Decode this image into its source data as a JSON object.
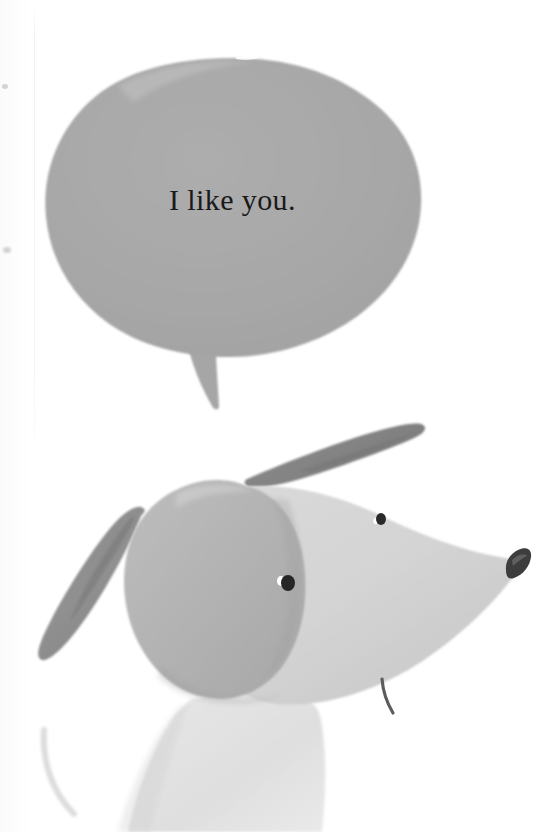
{
  "page": {
    "width": 542,
    "height": 832,
    "background_color": "#ffffff",
    "kind": "picture-book-illustration"
  },
  "speech_bubble": {
    "text": "I like you.",
    "fill_color": "#a8a8a8",
    "text_color": "#1a1a1a",
    "shape": "organic-hand-painted-oval",
    "tail": "curved-point-down-left",
    "bounds": {
      "x": 45,
      "y": 58,
      "width": 377,
      "height": 302
    },
    "tail_tip": {
      "x": 218,
      "y": 410
    }
  },
  "dog": {
    "label": "dog-head",
    "head_back_color": "#b4b4b4",
    "snout_color": "#d4d4d4",
    "head_shadow_color": "#c2c2c2",
    "ear_color": "#8c8c8c",
    "eye_color": "#2a2a2a",
    "eye_highlight_color": "#ffffff",
    "nose_color": "#3a3a3a",
    "mouth_color": "#5a5a5a",
    "body_color": "#e2e2e2",
    "parts": [
      {
        "name": "ear-upper-right",
        "kind": "tapered-stroke"
      },
      {
        "name": "ear-left-hanging",
        "kind": "tapered-stroke"
      },
      {
        "name": "head-dome",
        "kind": "rounded-dome"
      },
      {
        "name": "snout-wedge",
        "kind": "tapered-wedge"
      },
      {
        "name": "eye-near",
        "kind": "dot-with-highlight"
      },
      {
        "name": "eye-far",
        "kind": "dot"
      },
      {
        "name": "nose",
        "kind": "angled-blob"
      },
      {
        "name": "mouth-line",
        "kind": "short-curve"
      },
      {
        "name": "neck-body",
        "kind": "pale-column"
      },
      {
        "name": "tail-wisp",
        "kind": "faint-curve"
      }
    ]
  }
}
